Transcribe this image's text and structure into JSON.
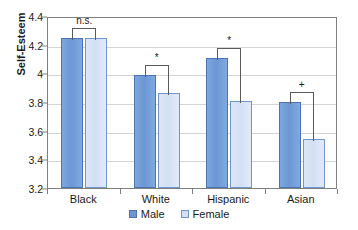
{
  "chart_data": {
    "type": "bar",
    "title": "",
    "xlabel": "",
    "ylabel": "Self-Esteem",
    "ylim": [
      3.2,
      4.4
    ],
    "ytick_labels": [
      "3.2",
      "3.4",
      "3.6",
      "3.8",
      "4",
      "4.2",
      "4.4"
    ],
    "ytick_values": [
      3.2,
      3.4,
      3.6,
      3.8,
      4.0,
      4.2,
      4.4
    ],
    "grid": true,
    "legend_position": "bottom",
    "categories": [
      "Black",
      "White",
      "Hispanic",
      "Asian"
    ],
    "series": [
      {
        "name": "Male",
        "color": "#6C97D4",
        "values": [
          4.245,
          3.985,
          4.11,
          3.8
        ]
      },
      {
        "name": "Female",
        "color": "#D2DFF4",
        "values": [
          4.245,
          3.865,
          3.81,
          3.54
        ]
      }
    ],
    "annotations": [
      {
        "category": "Black",
        "label": "n.s."
      },
      {
        "category": "White",
        "label": "*"
      },
      {
        "category": "Hispanic",
        "label": "*"
      },
      {
        "category": "Asian",
        "label": "+"
      }
    ]
  }
}
